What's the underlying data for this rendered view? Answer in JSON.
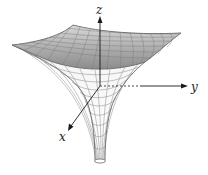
{
  "figure": {
    "axes": {
      "x_label": "x",
      "y_label": "y",
      "z_label": "z"
    },
    "colors": {
      "surface_top": "#9a9a9a",
      "surface_bottom": "#f2f2f2",
      "mesh_lines": "#7a7a7a",
      "axes": "#1a1a1a",
      "background": "#ffffff"
    }
  }
}
